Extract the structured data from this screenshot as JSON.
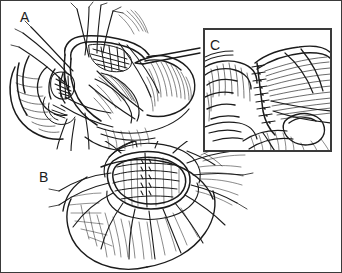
{
  "figure": {
    "medium": "pen-and-ink line drawing with cross-hatch shading",
    "background_color": "#ffffff",
    "ink_color": "#1b1b1b",
    "border_color": "#3a3a3a",
    "width": 342,
    "height": 273
  },
  "panels": [
    {
      "id": "A",
      "label": "A",
      "label_x": 19,
      "label_y": 9,
      "position": "top-left",
      "framed": false,
      "description": "Operative field showing the beginning of an anastomosis. Paired tissue edges are approximated with multiple fine traction sutures whose long free ends sweep across the field. A tubular structure is held open at the upper center; a closed forceps enters from the upper right. Surrounding soft tissue is rendered with dense parallel hatching and fine hair-like fibers.",
      "elements": [
        "traction-sutures",
        "tissue-edges",
        "open-lumen",
        "forceps-instrument",
        "hatched-soft-tissue"
      ]
    },
    {
      "id": "B",
      "label": "B",
      "label_x": 38,
      "label_y": 169,
      "position": "bottom-center",
      "framed": false,
      "description": "Wider operative view of the opened lumen. A roughly oval defect in the center is spanned by horizontal rows of running suture, with a vertical suture ladder through the middle. Numerous long suture tails radiate outward in a fan toward the lower field. Adjacent tissue is shaded with curved hatch strokes and fine fibers.",
      "elements": [
        "open-lumen",
        "running-suture-rows",
        "vertical-suture-ladder",
        "radiating-suture-tails",
        "hatched-soft-tissue"
      ]
    },
    {
      "id": "C",
      "label": "C",
      "label_x": 209,
      "label_y": 37,
      "position": "top-right-inset",
      "framed": true,
      "frame": {
        "x": 203,
        "y": 28,
        "width": 127,
        "height": 122,
        "stroke": "#3a3a3a",
        "stroke_width": 2
      },
      "description": "Magnified inset of the completed repair. Two tissue edges meet along a near-vertical line closed by a ladder of evenly spaced interrupted sutures with visible knots. The tissue at left is folded and ridged; the tissue at right fans away in long tapering hatch strokes. A small rounded opening sits at the lower right of the suture line.",
      "elements": [
        "interrupted-suture-ladder",
        "suture-knots",
        "approximated-tissue-edges",
        "residual-opening",
        "hatched-soft-tissue"
      ]
    }
  ]
}
